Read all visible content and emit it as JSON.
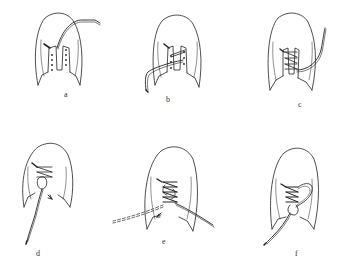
{
  "figure": {
    "ink_color": "#222222",
    "background": "#ffffff",
    "panels": [
      {
        "id": "a",
        "label": "a",
        "step": 1,
        "content": "Shoe top view; lace threaded through top eyelet, free end extending up-right"
      },
      {
        "id": "b",
        "label": "b",
        "step": 2,
        "content": "Lace crossing to opposite eyelets, free end hanging down-left"
      },
      {
        "id": "c",
        "label": "c",
        "step": 3,
        "content": "Lacing zig-zag through all eyelets, end extending out to right"
      },
      {
        "id": "d",
        "label": "d",
        "step": 4,
        "content": "Lace looped around bottom eyelet with arrow, end hanging down-left"
      },
      {
        "id": "e",
        "label": "e",
        "step": 5,
        "content": "Fully laced, lace pulled left (dashed) and right"
      },
      {
        "id": "f",
        "label": "f",
        "step": 6,
        "content": "Finished bow loop at right, end hanging down-left"
      }
    ]
  }
}
